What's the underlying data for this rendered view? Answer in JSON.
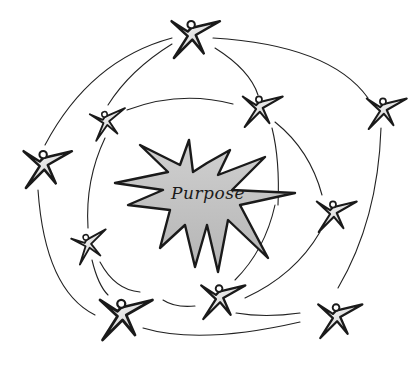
{
  "diagram": {
    "center_label": "Purpose",
    "center_shape": "starburst",
    "colors": {
      "star_fill": "#c4c4c4",
      "stroke": "#1a1a1a",
      "figure_fill": "#e8e8e8",
      "background": "#ffffff"
    },
    "figures": [
      {
        "id": "top",
        "x": 190,
        "y": 35
      },
      {
        "id": "upper-left-inner",
        "x": 105,
        "y": 122
      },
      {
        "id": "upper-right-inner",
        "x": 258,
        "y": 108
      },
      {
        "id": "right-outer",
        "x": 382,
        "y": 110
      },
      {
        "id": "left-outer",
        "x": 42,
        "y": 165
      },
      {
        "id": "right-middle",
        "x": 332,
        "y": 213
      },
      {
        "id": "left-middle",
        "x": 87,
        "y": 245
      },
      {
        "id": "bottom-left",
        "x": 120,
        "y": 315
      },
      {
        "id": "bottom-center",
        "x": 218,
        "y": 298
      },
      {
        "id": "bottom-right",
        "x": 335,
        "y": 317
      }
    ]
  }
}
